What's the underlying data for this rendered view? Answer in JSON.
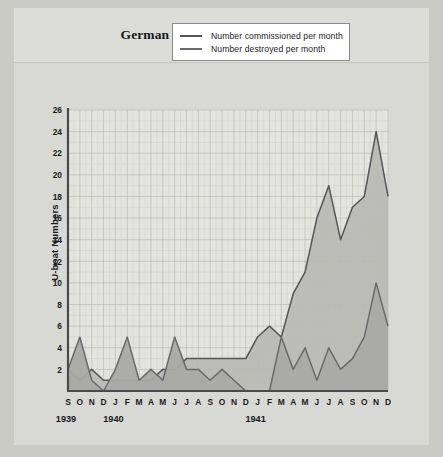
{
  "title": {
    "main": "German U-boat Strength",
    "years": "1939–1941"
  },
  "legend": {
    "items": [
      {
        "label": "Number commissioned per month",
        "color": "#55555a"
      },
      {
        "label": "Number destroyed per month",
        "color": "#6a6a6e"
      }
    ]
  },
  "axes": {
    "ylabel": "U-boat Numbers",
    "yticks": [
      2,
      4,
      6,
      8,
      10,
      12,
      14,
      16,
      18,
      20,
      22,
      24,
      26
    ],
    "xticks": [
      "S",
      "O",
      "N",
      "D",
      "J",
      "F",
      "M",
      "A",
      "M",
      "J",
      "J",
      "A",
      "S",
      "O",
      "N",
      "D",
      "J",
      "F",
      "M",
      "A",
      "M",
      "J",
      "J",
      "A",
      "S",
      "O",
      "N",
      "D"
    ],
    "year_labels": [
      {
        "text": "1939",
        "index": 0
      },
      {
        "text": "1940",
        "index": 4
      },
      {
        "text": "1941",
        "index": 16
      }
    ]
  },
  "colors": {
    "page_background": "#cbcbc6",
    "panel_background": "#d8d8d4",
    "plot_background": "#e3e3df",
    "grid_minor": "#cfcfca",
    "grid_major": "#b6b6b1",
    "axis": "#4a4a4e",
    "commissioned_line": "#55555a",
    "commissioned_fill": "#b9b9b5",
    "destroyed_line": "#6a6a6e",
    "destroyed_fill": "#a9a9a5",
    "legend_border": "#8a8a86",
    "legend_background": "#ffffff",
    "text": "#1a1a1d"
  },
  "chart_data": {
    "type": "area",
    "title": "German U-boat Strength 1939–1941",
    "xlabel": "",
    "ylabel": "U-boat Numbers",
    "ylim": [
      0,
      26
    ],
    "grid": true,
    "legend_position": "top-center",
    "categories": [
      "S 1939",
      "O 1939",
      "N 1939",
      "D 1939",
      "J 1940",
      "F 1940",
      "M 1940",
      "A 1940",
      "M 1940",
      "J 1940",
      "J 1940",
      "A 1940",
      "S 1940",
      "O 1940",
      "N 1940",
      "D 1940",
      "J 1941",
      "F 1941",
      "M 1941",
      "A 1941",
      "M 1941",
      "J 1941",
      "J 1941",
      "A 1941",
      "S 1941",
      "O 1941",
      "N 1941",
      "D 1941"
    ],
    "series": [
      {
        "name": "Number commissioned per month",
        "values": [
          2,
          1,
          2,
          1,
          1,
          1,
          1,
          1,
          2,
          2,
          3,
          3,
          3,
          3,
          3,
          3,
          5,
          6,
          5,
          9,
          11,
          16,
          19,
          14,
          17,
          18,
          24,
          18
        ]
      },
      {
        "name": "Number destroyed per month",
        "values": [
          2,
          5,
          1,
          0,
          2,
          5,
          1,
          2,
          1,
          5,
          2,
          2,
          1,
          2,
          1,
          0,
          0,
          0,
          5,
          2,
          4,
          1,
          4,
          2,
          3,
          5,
          10,
          6
        ]
      }
    ]
  }
}
